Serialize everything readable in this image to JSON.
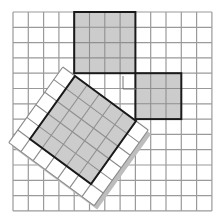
{
  "figure": {
    "grid": {
      "origin_x": 13,
      "origin_y": 12,
      "cell": 15.3,
      "cols": 13,
      "rows": 13,
      "line_color": "#9a9a9a"
    },
    "square_a": {
      "label": "3x3 square",
      "side_cells": 3,
      "col": 8,
      "row": 4
    },
    "square_b": {
      "label": "4x4 square",
      "side_cells": 4,
      "col": 4,
      "row": 0
    },
    "square_c": {
      "label": "5x5 tilted square",
      "side_cells": 5,
      "top_corner": [
        75,
        76
      ],
      "u": [
        12.2,
        9.0
      ],
      "v": [
        -9.0,
        12.6
      ]
    },
    "tile_border": {
      "u_range": [
        -1,
        6
      ],
      "v_range": [
        0,
        6
      ]
    },
    "right_angle_marker": {
      "x": 123,
      "y": 76,
      "size": 13
    },
    "colors": {
      "fill_gray": "#cccccc",
      "outline": "#1a1a1a",
      "tile_white": "#ffffff",
      "tile_line": "#8a8a8a",
      "shadow": "#bdbdbd",
      "grid": "#9a9a9a"
    }
  }
}
